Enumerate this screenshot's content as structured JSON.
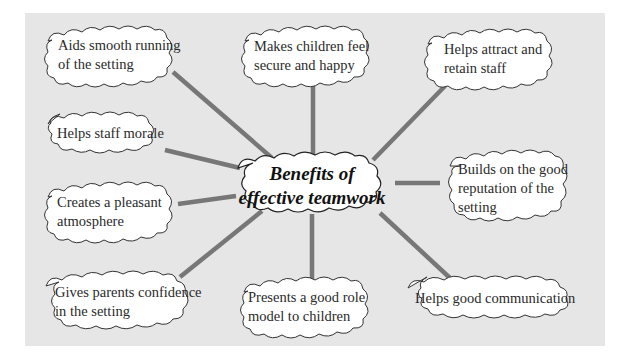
{
  "diagram": {
    "type": "mind-map",
    "colors": {
      "background_panel": "#e6e6e6",
      "cloud_fill": "#ffffff",
      "cloud_stroke": "#333333",
      "connector": "#777777"
    },
    "center": {
      "line1": "Benefits of",
      "line2": "effective teamwork"
    },
    "nodes": [
      {
        "id": "aids-smooth-running",
        "line1": "Aids smooth running",
        "line2": "of the setting",
        "line3": ""
      },
      {
        "id": "makes-children-secure",
        "line1": "Makes children feel",
        "line2": "secure and happy",
        "line3": ""
      },
      {
        "id": "attract-retain-staff",
        "line1": "Helps attract and",
        "line2": "retain staff",
        "line3": ""
      },
      {
        "id": "staff-morale",
        "line1": "Helps staff morale",
        "line2": "",
        "line3": ""
      },
      {
        "id": "good-reputation",
        "line1": "Builds on the good",
        "line2": "reputation of the",
        "line3": "setting"
      },
      {
        "id": "pleasant-atmosphere",
        "line1": "Creates a pleasant",
        "line2": "atmosphere",
        "line3": ""
      },
      {
        "id": "parents-confidence",
        "line1": "Gives parents confidence",
        "line2": "in the setting",
        "line3": ""
      },
      {
        "id": "role-model",
        "line1": "Presents a good role",
        "line2": "model to children",
        "line3": ""
      },
      {
        "id": "good-communication",
        "line1": "Helps good communication",
        "line2": "",
        "line3": ""
      }
    ]
  }
}
